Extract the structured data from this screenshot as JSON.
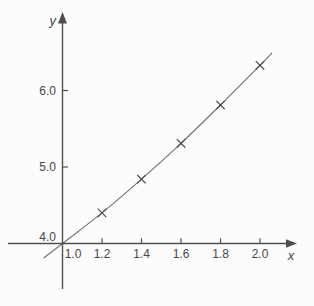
{
  "figure": {
    "background": "#fcfcfc",
    "axis_color": "#4f4f4f",
    "curve_color": "#707070",
    "marker_color": "#4a4a4a",
    "text_color": "#464646"
  },
  "chart_data": {
    "type": "line",
    "title": "",
    "xlabel": "x",
    "ylabel": "y",
    "marker": "x",
    "legend": "none",
    "grid": false,
    "xlim": [
      1.0,
      2.0
    ],
    "ylim": [
      4.0,
      6.0
    ],
    "x_ticks": [
      {
        "label": "1.0",
        "value": 1.0,
        "tick": false
      },
      {
        "label": "1.2",
        "value": 1.2,
        "tick": true
      },
      {
        "label": "1.4",
        "value": 1.4,
        "tick": true
      },
      {
        "label": "1.6",
        "value": 1.6,
        "tick": true
      },
      {
        "label": "1.8",
        "value": 1.8,
        "tick": true
      },
      {
        "label": "2.0",
        "value": 2.0,
        "tick": true
      }
    ],
    "y_ticks": [
      {
        "label": "4.0",
        "value": 4.0,
        "tick": false
      },
      {
        "label": "5.0",
        "value": 5.0,
        "tick": true
      },
      {
        "label": "6.0",
        "value": 6.0,
        "tick": true
      }
    ],
    "points": [
      {
        "x": 1.2,
        "y": 4.4
      },
      {
        "x": 1.4,
        "y": 4.84
      },
      {
        "x": 1.6,
        "y": 5.31
      },
      {
        "x": 1.8,
        "y": 5.81
      },
      {
        "x": 2.0,
        "y": 6.33
      }
    ],
    "curve_points": [
      {
        "x": 0.905,
        "y": 3.81
      },
      {
        "x": 1.0,
        "y": 4.0
      },
      {
        "x": 1.2,
        "y": 4.4
      },
      {
        "x": 1.4,
        "y": 4.84
      },
      {
        "x": 1.6,
        "y": 5.31
      },
      {
        "x": 1.8,
        "y": 5.81
      },
      {
        "x": 2.0,
        "y": 6.33
      },
      {
        "x": 2.06,
        "y": 6.49
      }
    ]
  }
}
